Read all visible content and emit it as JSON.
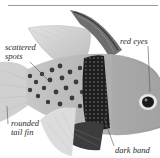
{
  "figure": {
    "labels": {
      "scattered_spots": [
        "scattered",
        "spots"
      ],
      "red_eyes": "red eyes",
      "rounded_tail_fin": [
        "rounded",
        "tail fin"
      ],
      "dark_band": "dark band"
    },
    "colors": {
      "body": "#b9b9b9",
      "spots": "#3a3a3a",
      "band": "#222222",
      "fin": "#d9d9d9",
      "leader_line": "#555555",
      "rule": "#9a9a9a"
    }
  }
}
